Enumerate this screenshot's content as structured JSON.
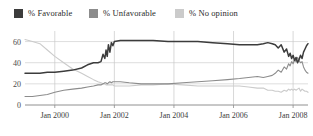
{
  "legend": {
    "position": "top",
    "items": [
      {
        "label": "% Favorable",
        "color": "#3c3c3c",
        "key": "favorable"
      },
      {
        "label": "% Unfavorable",
        "color": "#8c8c8c",
        "key": "unfavorable"
      },
      {
        "label": "% No opinion",
        "color": "#cbcbcb",
        "key": "no_opinion"
      }
    ]
  },
  "axes": {
    "y_ticks": [
      "0",
      "20",
      "40",
      "60"
    ],
    "x_ticks": [
      "Jan 2000",
      "Jan 2002",
      "Jan 2004",
      "Jan 2006",
      "Jan 2008"
    ]
  },
  "chart_data": {
    "type": "line",
    "title": "",
    "xlabel": "",
    "ylabel": "",
    "ylim": [
      0,
      70
    ],
    "xlim": [
      1999.0,
      2008.5
    ],
    "grid": true,
    "legend_position": "top",
    "x_tick_values": [
      2000.0,
      2002.0,
      2004.0,
      2006.0,
      2008.0
    ],
    "x_tick_labels": [
      "Jan 2000",
      "Jan 2002",
      "Jan 2004",
      "Jan 2006",
      "Jan 2008"
    ],
    "y_tick_values": [
      0,
      20,
      40,
      60
    ],
    "y_tick_labels": [
      "0",
      "20",
      "40",
      "60"
    ],
    "series": [
      {
        "name": "% Favorable",
        "color": "#3c3c3c",
        "x": [
          1999.0,
          1999.25,
          1999.5,
          1999.75,
          2000.0,
          2000.3,
          2000.6,
          2000.9,
          2001.1,
          2001.3,
          2001.45,
          2001.55,
          2001.62,
          2001.68,
          2001.72,
          2001.76,
          2001.8,
          2001.85,
          2001.9,
          2001.95,
          2002.0,
          2002.2,
          2002.5,
          2002.9,
          2003.3,
          2003.8,
          2004.3,
          2004.8,
          2005.3,
          2005.8,
          2006.2,
          2006.5,
          2006.8,
          2007.0,
          2007.15,
          2007.3,
          2007.4,
          2007.5,
          2007.6,
          2007.7,
          2007.78,
          2007.85,
          2007.9,
          2007.95,
          2008.0,
          2008.05,
          2008.1,
          2008.15,
          2008.2,
          2008.25,
          2008.3,
          2008.35,
          2008.4,
          2008.45,
          2008.5
        ],
        "y": [
          30,
          30,
          30,
          31,
          31,
          32,
          33,
          35,
          38,
          40,
          40,
          41,
          48,
          44,
          52,
          46,
          57,
          50,
          59,
          56,
          60,
          61,
          61,
          61,
          61,
          60,
          60,
          60,
          59,
          58,
          57,
          57,
          57,
          58,
          59,
          58,
          57,
          54,
          57,
          50,
          53,
          46,
          49,
          44,
          47,
          42,
          45,
          40,
          43,
          47,
          44,
          50,
          53,
          56,
          58
        ]
      },
      {
        "name": "% Unfavorable",
        "color": "#8c8c8c",
        "x": [
          1999.0,
          1999.25,
          1999.5,
          1999.75,
          2000.0,
          2000.3,
          2000.6,
          2000.9,
          2001.1,
          2001.3,
          2001.45,
          2001.55,
          2001.62,
          2001.68,
          2001.72,
          2001.76,
          2001.8,
          2001.85,
          2001.9,
          2001.95,
          2002.0,
          2002.2,
          2002.5,
          2002.9,
          2003.3,
          2003.8,
          2004.3,
          2004.8,
          2005.3,
          2005.8,
          2006.2,
          2006.5,
          2006.8,
          2007.0,
          2007.15,
          2007.3,
          2007.4,
          2007.5,
          2007.6,
          2007.7,
          2007.78,
          2007.85,
          2007.9,
          2007.95,
          2008.0,
          2008.05,
          2008.1,
          2008.15,
          2008.2,
          2008.25,
          2008.3,
          2008.35,
          2008.4,
          2008.45,
          2008.5
        ],
        "y": [
          8,
          8,
          9,
          10,
          12,
          14,
          15,
          16,
          17,
          18,
          19,
          19,
          20,
          21,
          21,
          20,
          21,
          22,
          21,
          22,
          22,
          22,
          21,
          20,
          20,
          20,
          21,
          22,
          23,
          24,
          25,
          26,
          27,
          26,
          27,
          28,
          30,
          33,
          31,
          36,
          34,
          39,
          37,
          41,
          39,
          43,
          41,
          45,
          42,
          40,
          41,
          36,
          33,
          31,
          30
        ]
      },
      {
        "name": "% No opinion",
        "color": "#cbcbcb",
        "x": [
          1999.0,
          1999.25,
          1999.5,
          1999.75,
          2000.0,
          2000.3,
          2000.6,
          2000.9,
          2001.1,
          2001.3,
          2001.45,
          2001.55,
          2001.62,
          2001.68,
          2001.72,
          2001.76,
          2001.8,
          2001.85,
          2001.9,
          2001.95,
          2002.0,
          2002.2,
          2002.5,
          2002.9,
          2003.3,
          2003.8,
          2004.3,
          2004.8,
          2005.3,
          2005.8,
          2006.2,
          2006.5,
          2006.8,
          2007.0,
          2007.15,
          2007.3,
          2007.4,
          2007.5,
          2007.6,
          2007.7,
          2007.78,
          2007.85,
          2007.9,
          2007.95,
          2008.0,
          2008.05,
          2008.1,
          2008.15,
          2008.2,
          2008.25,
          2008.3,
          2008.35,
          2008.4,
          2008.45,
          2008.5
        ],
        "y": [
          62,
          60,
          58,
          52,
          46,
          40,
          34,
          30,
          27,
          24,
          22,
          21,
          20,
          20,
          19,
          19,
          19,
          19,
          19,
          19,
          18,
          18,
          18,
          19,
          19,
          20,
          19,
          18,
          18,
          18,
          18,
          17,
          16,
          16,
          14,
          14,
          13,
          13,
          12,
          14,
          13,
          15,
          14,
          15,
          14,
          15,
          14,
          15,
          16,
          13,
          15,
          14,
          13,
          13,
          12
        ]
      }
    ]
  }
}
